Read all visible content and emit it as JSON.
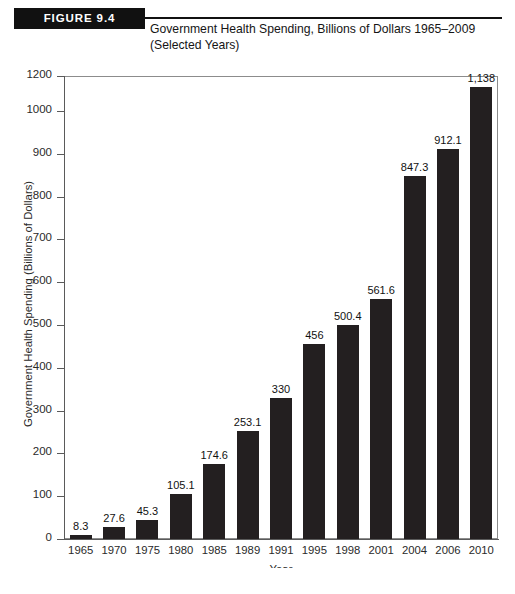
{
  "figure": {
    "badge_label": "FIGURE 9.4",
    "title_line1": "Government Health Spending, Billions of Dollars 1965–2009",
    "title_line2": "(Selected Years)"
  },
  "colors": {
    "bar": "#231f20",
    "badge_background": "#111111",
    "badge_text": "#ffffff",
    "axis": "#5a5a5a",
    "plot_border": "#8c8c8c",
    "text": "#1a1a1a"
  },
  "chart_data": {
    "type": "bar",
    "title": "Government Health Spending, Billions of Dollars 1965–2009 (Selected Years)",
    "xlabel": "Year",
    "ylabel": "Government Health Spending (Billions of Dollars)",
    "categories": [
      "1965",
      "1970",
      "1975",
      "1980",
      "1985",
      "1989",
      "1991",
      "1995",
      "1998",
      "2001",
      "2004",
      "2006",
      "2010"
    ],
    "values": [
      8.3,
      27.6,
      45.3,
      105.1,
      174.6,
      253.1,
      330,
      456,
      500.4,
      561.6,
      847.3,
      912.1,
      1138
    ],
    "value_labels": [
      "8.3",
      "27.6",
      "45.3",
      "105.1",
      "174.6",
      "253.1",
      "330",
      "456",
      "500.4",
      "561.6",
      "847.3",
      "912.1",
      "1,138"
    ],
    "ytick_labels": [
      "0",
      "100",
      "200",
      "300",
      "400",
      "500",
      "600",
      "700",
      "800",
      "900",
      "1000",
      "1200"
    ],
    "ytick_values": [
      0,
      100,
      200,
      300,
      400,
      500,
      600,
      700,
      800,
      900,
      1000,
      1200
    ],
    "ylim": [
      0,
      1200
    ],
    "grid": false,
    "legend": null
  }
}
